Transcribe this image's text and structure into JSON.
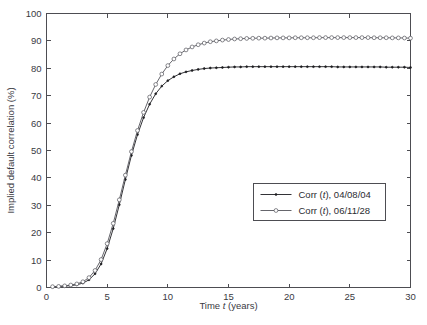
{
  "chart_data": {
    "type": "line",
    "title": "",
    "xlabel": "Time t (years)",
    "xlabel_prefix": "Time ",
    "xlabel_italic": "t",
    "xlabel_suffix": " (years)",
    "ylabel": "Implied default correlation (%)",
    "xlim": [
      0,
      30
    ],
    "ylim": [
      0,
      100
    ],
    "xticks": [
      0,
      5,
      10,
      15,
      20,
      25,
      30
    ],
    "yticks": [
      0,
      10,
      20,
      30,
      40,
      50,
      60,
      70,
      80,
      90,
      100
    ],
    "xtick_labels": [
      "0",
      "5",
      "10",
      "15",
      "20",
      "25",
      "30"
    ],
    "ytick_labels": [
      "0",
      "10",
      "20",
      "30",
      "40",
      "50",
      "60",
      "70",
      "80",
      "90",
      "100"
    ],
    "grid": false,
    "legend_position": "center-right",
    "axis_color": "#4d4d52",
    "background": "#ffffff",
    "x": [
      0.5,
      1.0,
      1.5,
      2.0,
      2.5,
      3.0,
      3.5,
      4.0,
      4.5,
      5.0,
      5.5,
      6.0,
      6.5,
      7.0,
      7.5,
      8.0,
      8.5,
      9.0,
      9.5,
      10.0,
      10.5,
      11.0,
      11.5,
      12.0,
      12.5,
      13.0,
      13.5,
      14.0,
      14.5,
      15.0,
      15.5,
      16.0,
      16.5,
      17.0,
      17.5,
      18.0,
      18.5,
      19.0,
      19.5,
      20.0,
      20.5,
      21.0,
      21.5,
      22.0,
      22.5,
      23.0,
      23.5,
      24.0,
      24.5,
      25.0,
      25.5,
      26.0,
      26.5,
      27.0,
      27.5,
      28.0,
      28.5,
      29.0,
      29.5,
      30.0
    ],
    "series": [
      {
        "name": "Corr (t), 04/08/04",
        "name_prefix": "Corr (",
        "name_italic": "t",
        "name_suffix": "), 04/08/04",
        "color": "#1c1c20",
        "marker": "dot",
        "plateau": 80.5,
        "values": [
          0.3,
          0.4,
          0.5,
          0.7,
          1.0,
          1.6,
          2.8,
          5.0,
          8.6,
          14.2,
          21.5,
          30.2,
          39.4,
          48.2,
          55.8,
          62.0,
          66.9,
          70.7,
          73.5,
          75.5,
          76.9,
          78.0,
          78.7,
          79.2,
          79.6,
          79.9,
          80.1,
          80.2,
          80.3,
          80.4,
          80.5,
          80.5,
          80.6,
          80.6,
          80.6,
          80.6,
          80.6,
          80.6,
          80.6,
          80.6,
          80.6,
          80.6,
          80.6,
          80.6,
          80.6,
          80.6,
          80.6,
          80.5,
          80.5,
          80.5,
          80.5,
          80.5,
          80.5,
          80.5,
          80.5,
          80.4,
          80.4,
          80.4,
          80.4,
          80.3
        ]
      },
      {
        "name": "Corr (t), 06/11/28",
        "name_prefix": "Corr (",
        "name_italic": "t",
        "name_suffix": "), 06/11/28",
        "color": "#55555b",
        "marker": "circle",
        "plateau": 91.0,
        "values": [
          0.3,
          0.4,
          0.6,
          0.9,
          1.3,
          2.1,
          3.6,
          6.2,
          10.2,
          16.0,
          23.4,
          32.0,
          41.0,
          49.6,
          57.3,
          63.9,
          69.5,
          74.1,
          77.9,
          81.0,
          83.4,
          85.3,
          86.7,
          87.8,
          88.6,
          89.2,
          89.7,
          90.0,
          90.3,
          90.5,
          90.7,
          90.8,
          90.9,
          90.95,
          91.0,
          91.0,
          91.05,
          91.1,
          91.1,
          91.1,
          91.15,
          91.15,
          91.15,
          91.15,
          91.2,
          91.2,
          91.2,
          91.2,
          91.2,
          91.2,
          91.2,
          91.2,
          91.2,
          91.15,
          91.15,
          91.15,
          91.1,
          91.1,
          91.05,
          91.0
        ]
      }
    ]
  }
}
